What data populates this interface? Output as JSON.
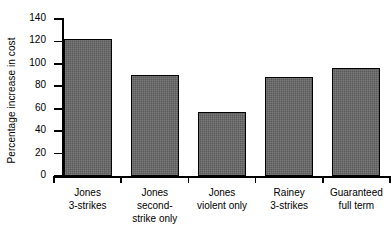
{
  "chart_data": {
    "type": "bar",
    "title": "",
    "xlabel": "",
    "ylabel": "Percentage increase in cost",
    "categories": [
      "Jones\n3-strikes",
      "Jones\nsecond-\nstrike only",
      "Jones\nviolent only",
      "Rainey\n3-strikes",
      "Guaranteed\nfull term"
    ],
    "values": [
      122,
      90,
      57,
      88,
      96
    ],
    "ylim": [
      0,
      140
    ],
    "yticks": [
      0,
      20,
      40,
      60,
      80,
      100,
      120,
      140
    ],
    "ytick_labels": [
      "0",
      "20",
      "40",
      "60",
      "80",
      "100",
      "120",
      "140"
    ],
    "grid": false,
    "legend": false,
    "bar_color": "#5a5a5a",
    "bar_edge_color": "#000000",
    "axis_color": "#000000",
    "background_color": "#ffffff"
  },
  "axis": {
    "y_title": "Percentage increase in cost"
  }
}
